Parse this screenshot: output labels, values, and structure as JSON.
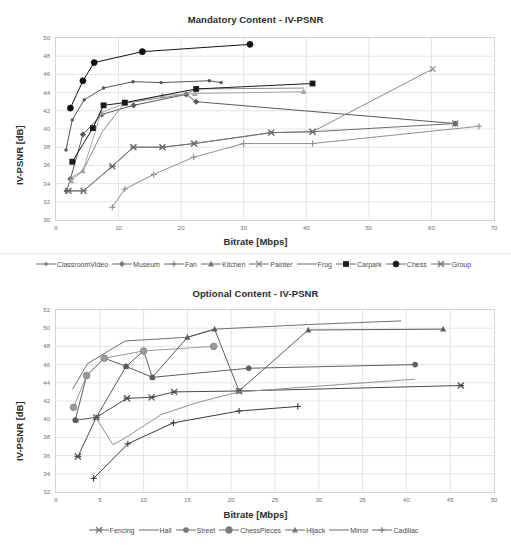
{
  "figure": {
    "axis_label_y": "IV-PSNR [dB]",
    "axis_label_x": "Bitrate [Mbps]"
  },
  "chart_data": [
    {
      "type": "line",
      "title": "Mandatory Content - IV-PSNR",
      "xlabel": "Bitrate [Mbps]",
      "ylabel": "IV-PSNR [dB]",
      "xlim": [
        0,
        70
      ],
      "ylim": [
        30,
        50
      ],
      "xticks": [
        0,
        10,
        20,
        30,
        40,
        50,
        60,
        70
      ],
      "yticks": [
        30,
        32,
        34,
        36,
        38,
        40,
        42,
        44,
        46,
        48,
        50
      ],
      "grid": true,
      "legend_position": "bottom",
      "series": [
        {
          "name": "ClassroomVideo",
          "marker": "line-dot",
          "color": "#555555",
          "points": [
            [
              1.6,
              37.7
            ],
            [
              2.6,
              41.0
            ],
            [
              4.5,
              43.2
            ],
            [
              7.6,
              44.5
            ],
            [
              12.3,
              45.2
            ],
            [
              16.8,
              45.1
            ],
            [
              24.5,
              45.3
            ],
            [
              26.4,
              45.1
            ]
          ]
        },
        {
          "name": "Museum",
          "marker": "diamond",
          "color": "#5a5a5a",
          "points": [
            [
              1.7,
              33.2
            ],
            [
              2.3,
              34.5
            ],
            [
              4.3,
              39.4
            ],
            [
              7.3,
              41.6
            ],
            [
              12.4,
              42.6
            ],
            [
              20.8,
              43.8
            ],
            [
              22.4,
              43.0
            ],
            [
              63.8,
              40.6
            ]
          ]
        },
        {
          "name": "Fan",
          "marker": "plus",
          "color": "#8f8f8f",
          "points": [
            [
              9.0,
              31.4
            ],
            [
              11.0,
              33.4
            ],
            [
              15.6,
              35.0
            ],
            [
              22.0,
              36.9
            ],
            [
              30.0,
              38.4
            ],
            [
              41.0,
              38.4
            ],
            [
              67.6,
              40.3
            ]
          ]
        },
        {
          "name": "Kitchen",
          "marker": "triangle",
          "color": "#a8a8a8",
          "points": [
            [
              2.4,
              34.3
            ],
            [
              4.3,
              35.4
            ],
            [
              7.2,
              41.8
            ],
            [
              11.0,
              42.8
            ],
            [
              17.0,
              43.7
            ],
            [
              22.2,
              43.9
            ],
            [
              39.6,
              44.1
            ]
          ]
        },
        {
          "name": "Painter",
          "marker": "x",
          "color": "#8a8a8a",
          "points": [
            [
              2.0,
              33.2
            ],
            [
              4.4,
              33.2
            ],
            [
              9.0,
              35.9
            ],
            [
              12.3,
              38.0
            ],
            [
              17.0,
              38.0
            ],
            [
              22.0,
              38.4
            ],
            [
              34.4,
              39.6
            ],
            [
              41.0,
              39.7
            ],
            [
              60.2,
              46.6
            ]
          ]
        },
        {
          "name": "Frog",
          "marker": "none",
          "color": "#8a8a8a",
          "points": [
            [
              2.1,
              34.5
            ],
            [
              4.3,
              35.4
            ],
            [
              7.4,
              39.7
            ],
            [
              11.0,
              42.9
            ],
            [
              12.5,
              43.0
            ],
            [
              20.6,
              43.8
            ],
            [
              22.4,
              44.4
            ],
            [
              39.6,
              44.5
            ]
          ]
        },
        {
          "name": "Carpark",
          "marker": "square",
          "color": "#1a1a1a",
          "points": [
            [
              2.6,
              36.4
            ],
            [
              5.9,
              40.1
            ],
            [
              7.6,
              42.6
            ],
            [
              11.0,
              42.9
            ],
            [
              22.4,
              44.4
            ],
            [
              41.0,
              45.0
            ]
          ]
        },
        {
          "name": "Chess",
          "marker": "circle",
          "color": "#111111",
          "points": [
            [
              2.3,
              42.3
            ],
            [
              4.3,
              45.3
            ],
            [
              6.1,
              47.3
            ],
            [
              13.8,
              48.5
            ],
            [
              31.0,
              49.3
            ]
          ]
        },
        {
          "name": "Group",
          "marker": "star-x",
          "color": "#6d6d6d",
          "points": [
            [
              2.0,
              33.2
            ],
            [
              4.4,
              33.2
            ],
            [
              9.0,
              35.9
            ],
            [
              12.4,
              38.0
            ],
            [
              17.0,
              38.0
            ],
            [
              22.1,
              38.4
            ],
            [
              34.4,
              39.6
            ],
            [
              41.0,
              39.7
            ],
            [
              63.8,
              40.6
            ]
          ]
        }
      ]
    },
    {
      "type": "line",
      "title": "Optional Content - IV-PSNR",
      "xlabel": "Bitrate [Mbps]",
      "ylabel": "IV-PSNR [dB]",
      "xlim": [
        0,
        50
      ],
      "ylim": [
        32,
        52
      ],
      "xticks": [
        0,
        5,
        10,
        15,
        20,
        25,
        30,
        35,
        40,
        45,
        50
      ],
      "yticks": [
        32,
        34,
        36,
        38,
        40,
        42,
        44,
        46,
        48,
        50,
        52
      ],
      "grid": true,
      "legend_position": "bottom",
      "series": [
        {
          "name": "Fencing",
          "marker": "star-x",
          "color": "#4a4a4a",
          "points": [
            [
              2.5,
              35.9
            ],
            [
              4.6,
              40.2
            ],
            [
              8.1,
              42.3
            ],
            [
              10.9,
              42.4
            ],
            [
              13.5,
              43.0
            ],
            [
              20.9,
              43.1
            ],
            [
              46.2,
              43.7
            ]
          ]
        },
        {
          "name": "Hall",
          "marker": "none",
          "color": "#6f6f6f",
          "points": [
            [
              1.9,
              43.3
            ],
            [
              3.6,
              46.1
            ],
            [
              7.9,
              48.6
            ],
            [
              15.0,
              49.0
            ],
            [
              18.2,
              49.9
            ],
            [
              28.8,
              50.4
            ],
            [
              39.4,
              50.8
            ]
          ]
        },
        {
          "name": "Street",
          "marker": "dot",
          "color": "#5e5e5e",
          "points": [
            [
              2.2,
              39.9
            ],
            [
              3.5,
              44.8
            ],
            [
              5.5,
              46.7
            ],
            [
              8.0,
              45.8
            ],
            [
              10.0,
              47.5
            ],
            [
              11.0,
              44.6
            ],
            [
              22.0,
              45.6
            ],
            [
              41.0,
              46.0
            ]
          ]
        },
        {
          "name": "ChessPieces",
          "marker": "circle-lg",
          "color": "#9a9a9a",
          "points": [
            [
              2.0,
              41.3
            ],
            [
              3.5,
              44.8
            ],
            [
              5.5,
              46.7
            ],
            [
              10.0,
              47.5
            ],
            [
              18.0,
              48.0
            ]
          ]
        },
        {
          "name": "Hijack",
          "marker": "triangle",
          "color": "#5a5a5a",
          "points": [
            [
              2.3,
              39.9
            ],
            [
              4.6,
              40.2
            ],
            [
              8.0,
              45.8
            ],
            [
              11.0,
              44.6
            ],
            [
              15.0,
              49.0
            ],
            [
              18.1,
              49.9
            ],
            [
              20.9,
              43.1
            ],
            [
              28.8,
              49.8
            ],
            [
              44.2,
              49.9
            ]
          ]
        },
        {
          "name": "Mirror",
          "marker": "none",
          "color": "#909090",
          "points": [
            [
              4.6,
              40.1
            ],
            [
              6.5,
              37.2
            ],
            [
              8.0,
              38.0
            ],
            [
              12.0,
              40.5
            ],
            [
              16.0,
              41.8
            ],
            [
              20.9,
              43.0
            ],
            [
              28.0,
              43.5
            ],
            [
              41.0,
              44.4
            ]
          ]
        },
        {
          "name": "Cadillac",
          "marker": "plus-line",
          "color": "#3a3a3a",
          "points": [
            [
              4.3,
              33.5
            ],
            [
              8.2,
              37.3
            ],
            [
              13.4,
              39.6
            ],
            [
              20.9,
              40.9
            ],
            [
              27.6,
              41.4
            ]
          ]
        }
      ]
    }
  ],
  "legends": [
    {
      "items": [
        {
          "label": "ClassroomVideo",
          "marker": "line-dot"
        },
        {
          "label": "Museum",
          "marker": "diamond"
        },
        {
          "label": "Fan",
          "marker": "plus"
        },
        {
          "label": "Kitchen",
          "marker": "triangle"
        },
        {
          "label": "Painter",
          "marker": "x"
        },
        {
          "label": "Frog",
          "marker": "none"
        },
        {
          "label": "Carpark",
          "marker": "square"
        },
        {
          "label": "Chess",
          "marker": "circle"
        },
        {
          "label": "Group",
          "marker": "star-x"
        }
      ]
    },
    {
      "items": [
        {
          "label": "Fencing",
          "marker": "star-x"
        },
        {
          "label": "Hall",
          "marker": "none"
        },
        {
          "label": "Street",
          "marker": "dot"
        },
        {
          "label": "ChessPieces",
          "marker": "circle-lg"
        },
        {
          "label": "Hijack",
          "marker": "triangle"
        },
        {
          "label": "Mirror",
          "marker": "none"
        },
        {
          "label": "Cadillac",
          "marker": "plus-line"
        }
      ]
    }
  ]
}
